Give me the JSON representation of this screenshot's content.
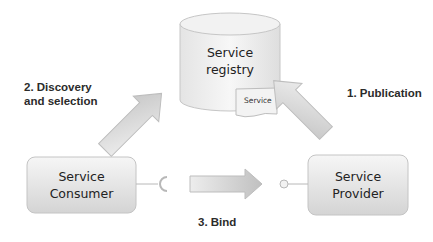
{
  "diagram": {
    "registry": {
      "line1": "Service",
      "line2": "registry"
    },
    "service_doc": {
      "label": "Service"
    },
    "consumer": {
      "line1": "Service",
      "line2": "Consumer"
    },
    "provider": {
      "line1": "Service",
      "line2": "Provider"
    },
    "steps": {
      "publication": "1. Publication",
      "discovery_line1": "2. Discovery",
      "discovery_line2": "and selection",
      "bind": "3. Bind"
    },
    "colors": {
      "shape_fill_light": "#f4f4f4",
      "shape_fill_dark": "#d6d6d6",
      "shape_stroke": "#bdbdbd",
      "arrow_fill_light": "#eeeeee",
      "arrow_fill_dark": "#c2c2c2",
      "text": "#2b2b2b"
    }
  }
}
